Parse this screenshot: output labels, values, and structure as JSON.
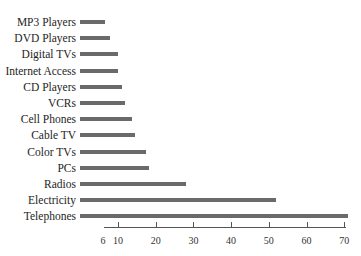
{
  "chart_data": {
    "type": "bar",
    "orientation": "horizontal",
    "title": "",
    "xlabel": "",
    "ylabel": "",
    "categories": [
      "MP3 Players",
      "DVD Players",
      "Digital TVs",
      "Internet Access",
      "CD Players",
      "VCRs",
      "Cell Phones",
      "Cable TV",
      "Color TVs",
      "PCs",
      "Radios",
      "Electricity",
      "Telephones"
    ],
    "values": [
      6.5,
      7.8,
      10,
      10,
      11,
      11.9,
      13.7,
      14.5,
      17.4,
      18.2,
      28,
      52,
      71
    ],
    "xticks": [
      6,
      10,
      20,
      30,
      40,
      50,
      60,
      70
    ],
    "xlim": [
      0,
      71
    ],
    "grid": false,
    "legend": null,
    "bar_color": "#6a6a6a"
  }
}
